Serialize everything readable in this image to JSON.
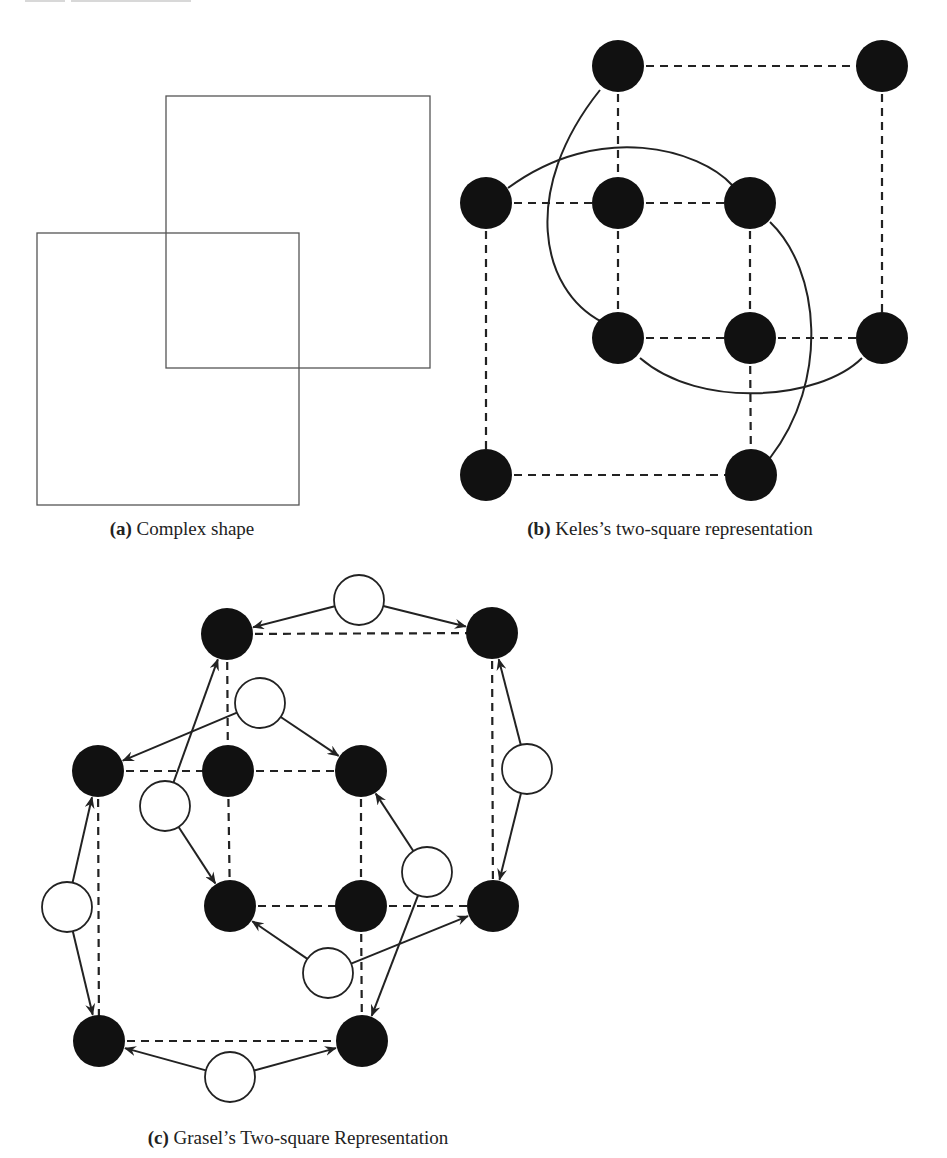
{
  "figure": {
    "panels": [
      {
        "id": "a",
        "label": "(a)",
        "title": "Complex shape",
        "squares": [
          {
            "x": 166,
            "y": 96,
            "w": 264,
            "h": 272
          },
          {
            "x": 37,
            "y": 233,
            "w": 262,
            "h": 272
          }
        ]
      },
      {
        "id": "b",
        "label": "(b)",
        "title": "Keles’s two-square representation",
        "node_color": "#111111",
        "node_radius": 26,
        "nodes": [
          {
            "id": "b1",
            "x": 618,
            "y": 66
          },
          {
            "id": "b2",
            "x": 882,
            "y": 66
          },
          {
            "id": "b3",
            "x": 486,
            "y": 203
          },
          {
            "id": "b4",
            "x": 618,
            "y": 203
          },
          {
            "id": "b5",
            "x": 750,
            "y": 203
          },
          {
            "id": "b6",
            "x": 618,
            "y": 338
          },
          {
            "id": "b7",
            "x": 750,
            "y": 338
          },
          {
            "id": "b8",
            "x": 882,
            "y": 338
          },
          {
            "id": "b9",
            "x": 486,
            "y": 475
          },
          {
            "id": "b10",
            "x": 751,
            "y": 475
          }
        ],
        "dashed_edges": [
          [
            "b1",
            "b2"
          ],
          [
            "b1",
            "b4"
          ],
          [
            "b2",
            "b8"
          ],
          [
            "b4",
            "b6"
          ],
          [
            "b3",
            "b4"
          ],
          [
            "b4",
            "b5"
          ],
          [
            "b3",
            "b9"
          ],
          [
            "b5",
            "b7"
          ],
          [
            "b6",
            "b7"
          ],
          [
            "b7",
            "b8"
          ],
          [
            "b7",
            "b10"
          ],
          [
            "b9",
            "b10"
          ]
        ],
        "curves": [
          "M 600 90 C 520 190, 540 290, 602 322",
          "M 508 188 C 600 120, 700 150, 732 185",
          "M 770 222 C 820 270, 830 380, 770 458",
          "M 640 358 C 700 410, 820 400, 862 358"
        ]
      },
      {
        "id": "c",
        "label": "(c)",
        "title": "Grasel’s Two-square Representation",
        "black_node_radius": 26,
        "white_node_radius": 25,
        "black_nodes": [
          {
            "id": "c1",
            "x": 227,
            "y": 634
          },
          {
            "id": "c2",
            "x": 492,
            "y": 633
          },
          {
            "id": "c3",
            "x": 98,
            "y": 771
          },
          {
            "id": "c4",
            "x": 228,
            "y": 771
          },
          {
            "id": "c5",
            "x": 361,
            "y": 771
          },
          {
            "id": "c6",
            "x": 230,
            "y": 906
          },
          {
            "id": "c7",
            "x": 361,
            "y": 906
          },
          {
            "id": "c8",
            "x": 493,
            "y": 906
          },
          {
            "id": "c9",
            "x": 99,
            "y": 1041
          },
          {
            "id": "c10",
            "x": 362,
            "y": 1041
          }
        ],
        "white_nodes": [
          {
            "id": "w1",
            "x": 359,
            "y": 600
          },
          {
            "id": "w2",
            "x": 260,
            "y": 703
          },
          {
            "id": "w3",
            "x": 165,
            "y": 806
          },
          {
            "id": "w4",
            "x": 527,
            "y": 769
          },
          {
            "id": "w5",
            "x": 427,
            "y": 872
          },
          {
            "id": "w6",
            "x": 67,
            "y": 907
          },
          {
            "id": "w7",
            "x": 328,
            "y": 973
          },
          {
            "id": "w8",
            "x": 230,
            "y": 1077
          }
        ],
        "dashed_edges": [
          [
            "c1",
            "c2"
          ],
          [
            "c1",
            "c4"
          ],
          [
            "c2",
            "c8"
          ],
          [
            "c3",
            "c4"
          ],
          [
            "c4",
            "c5"
          ],
          [
            "c3",
            "c9"
          ],
          [
            "c4",
            "c6"
          ],
          [
            "c5",
            "c7"
          ],
          [
            "c6",
            "c7"
          ],
          [
            "c7",
            "c8"
          ],
          [
            "c7",
            "c10"
          ],
          [
            "c9",
            "c10"
          ]
        ],
        "arrows": [
          [
            "w1",
            "c1"
          ],
          [
            "w1",
            "c2"
          ],
          [
            "w2",
            "c3"
          ],
          [
            "w2",
            "c5"
          ],
          [
            "w3",
            "c1"
          ],
          [
            "w3",
            "c6"
          ],
          [
            "w4",
            "c2"
          ],
          [
            "w4",
            "c8"
          ],
          [
            "w5",
            "c5"
          ],
          [
            "w5",
            "c10"
          ],
          [
            "w6",
            "c3"
          ],
          [
            "w6",
            "c9"
          ],
          [
            "w7",
            "c6"
          ],
          [
            "w7",
            "c8"
          ],
          [
            "w8",
            "c9"
          ],
          [
            "w8",
            "c10"
          ]
        ]
      }
    ],
    "captions": {
      "a": {
        "label": "(a)",
        "text": " Complex shape",
        "x": 182,
        "y": 518
      },
      "b": {
        "label": "(b)",
        "text": " Keles’s two-square representation",
        "x": 670,
        "y": 518
      },
      "c": {
        "label": "(c)",
        "text": " Grasel’s Two-square Representation",
        "x": 298,
        "y": 1127
      }
    }
  }
}
